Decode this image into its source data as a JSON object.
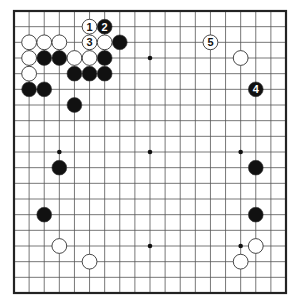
{
  "diagram": {
    "type": "go-board",
    "size": 19,
    "colors": {
      "background": "#ffffff",
      "line": "#555555",
      "border": "#222222",
      "black_stone": "#111111",
      "white_stone": "#ffffff",
      "stone_outline": "#333333"
    },
    "star_points": [
      [
        3,
        3
      ],
      [
        9,
        3
      ],
      [
        15,
        3
      ],
      [
        3,
        9
      ],
      [
        9,
        9
      ],
      [
        15,
        9
      ],
      [
        3,
        15
      ],
      [
        9,
        15
      ],
      [
        15,
        15
      ]
    ],
    "stones": [
      {
        "color": "black",
        "col": 6,
        "row": 1,
        "label": "2"
      },
      {
        "color": "black",
        "col": 7,
        "row": 2,
        "label": ""
      },
      {
        "color": "black",
        "col": 2,
        "row": 3,
        "label": ""
      },
      {
        "color": "black",
        "col": 3,
        "row": 3,
        "label": ""
      },
      {
        "color": "black",
        "col": 6,
        "row": 3,
        "label": ""
      },
      {
        "color": "black",
        "col": 4,
        "row": 4,
        "label": ""
      },
      {
        "color": "black",
        "col": 5,
        "row": 4,
        "label": ""
      },
      {
        "color": "black",
        "col": 6,
        "row": 4,
        "label": ""
      },
      {
        "color": "black",
        "col": 1,
        "row": 5,
        "label": ""
      },
      {
        "color": "black",
        "col": 2,
        "row": 5,
        "label": ""
      },
      {
        "color": "black",
        "col": 4,
        "row": 6,
        "label": ""
      },
      {
        "color": "black",
        "col": 16,
        "row": 5,
        "label": "4"
      },
      {
        "color": "black",
        "col": 3,
        "row": 10,
        "label": ""
      },
      {
        "color": "black",
        "col": 16,
        "row": 10,
        "label": ""
      },
      {
        "color": "black",
        "col": 2,
        "row": 13,
        "label": ""
      },
      {
        "color": "black",
        "col": 16,
        "row": 13,
        "label": ""
      },
      {
        "color": "white",
        "col": 5,
        "row": 1,
        "label": "1"
      },
      {
        "color": "white",
        "col": 1,
        "row": 2,
        "label": ""
      },
      {
        "color": "white",
        "col": 2,
        "row": 2,
        "label": ""
      },
      {
        "color": "white",
        "col": 3,
        "row": 2,
        "label": ""
      },
      {
        "color": "white",
        "col": 5,
        "row": 2,
        "label": "3"
      },
      {
        "color": "white",
        "col": 6,
        "row": 2,
        "label": ""
      },
      {
        "color": "white",
        "col": 13,
        "row": 2,
        "label": "5"
      },
      {
        "color": "white",
        "col": 1,
        "row": 3,
        "label": ""
      },
      {
        "color": "white",
        "col": 4,
        "row": 3,
        "label": ""
      },
      {
        "color": "white",
        "col": 5,
        "row": 3,
        "label": ""
      },
      {
        "color": "white",
        "col": 15,
        "row": 3,
        "label": ""
      },
      {
        "color": "white",
        "col": 1,
        "row": 4,
        "label": ""
      },
      {
        "color": "white",
        "col": 3,
        "row": 15,
        "label": ""
      },
      {
        "color": "white",
        "col": 16,
        "row": 15,
        "label": ""
      },
      {
        "color": "white",
        "col": 5,
        "row": 16,
        "label": ""
      },
      {
        "color": "white",
        "col": 15,
        "row": 16,
        "label": ""
      }
    ]
  }
}
